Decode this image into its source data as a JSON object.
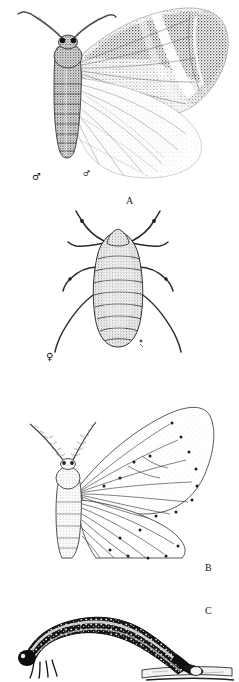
{
  "plate": {
    "background_color": "#ffffff",
    "ink_color": "#1a1a1a",
    "width": 239,
    "height": 682,
    "caption_font_size": 10
  },
  "figures": [
    {
      "id": "figure-a",
      "label": "A",
      "label_x": 126,
      "label_y": 196,
      "subject": "adult-male-moth-wings-spread",
      "sex_symbol": "♂",
      "sex_symbol_x": 32,
      "sex_symbol_y": 172,
      "secondary_mark": "♂",
      "secondary_mark_x": 83,
      "secondary_mark_y": 170,
      "description": "stippled halftone adult moth with mottled grey forewings and pale hindwings, feathered antennae",
      "bounds": {
        "x": 12,
        "y": 4,
        "w": 215,
        "h": 180
      }
    },
    {
      "id": "figure-female",
      "label": "",
      "subject": "wingless-female-moth-dorsal",
      "sex_symbol": "♀",
      "sex_symbol_x": 46,
      "sex_symbol_y": 352,
      "description": "dorsal view of apterous female with segmented abdomen and six legs",
      "bounds": {
        "x": 52,
        "y": 208,
        "w": 130,
        "h": 142
      }
    },
    {
      "id": "figure-b",
      "label": "B",
      "label_x": 205,
      "label_y": 545,
      "subject": "adult-moth-line-drawing-venation",
      "description": "outline drawing of moth showing wing venation, vein-end dots and plumose antennae",
      "bounds": {
        "x": 30,
        "y": 382,
        "w": 190,
        "h": 160
      }
    },
    {
      "id": "figure-c",
      "label": "C",
      "label_x": 205,
      "label_y": 592,
      "subject": "looper-caterpillar-on-twig",
      "description": "dark arched geometrid looper larva gripping a twig",
      "bounds": {
        "x": 14,
        "y": 595,
        "w": 215,
        "h": 80
      }
    }
  ],
  "caption_labels": [
    "A",
    "B",
    "C"
  ],
  "sex_symbols": {
    "male": "♂",
    "female": "♀"
  }
}
